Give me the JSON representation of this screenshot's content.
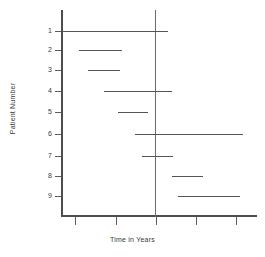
{
  "chart_data": {
    "type": "bar",
    "title": "",
    "subtitle": "",
    "xlabel": "Time in Years",
    "ylabel": "Patient Number",
    "orientation": "horizontal",
    "grid": false,
    "legend": null,
    "legend_position": "none",
    "categories": [
      "1",
      "2",
      "3",
      "4",
      "5",
      "6",
      "7",
      "8",
      "9"
    ],
    "xlim": [
      0,
      5
    ],
    "ylim": [
      0.5,
      9.5
    ],
    "xticks": [
      0,
      1,
      2,
      3,
      4
    ],
    "xticklabels": [
      "",
      "",
      "",
      "",
      ""
    ],
    "yticks": [
      1,
      2,
      3,
      4,
      5,
      6,
      7,
      8,
      9
    ],
    "yticklabels": [
      "1",
      "2",
      "3",
      "4",
      "5",
      "6",
      "7",
      "8",
      "9"
    ],
    "annotations": [
      {
        "name": "study-reference-line",
        "type": "vline",
        "x": 2.0,
        "label": ""
      }
    ],
    "series": [
      {
        "name": "Follow-up interval",
        "type": "range-bar",
        "values": [
          {
            "patient": "1",
            "start": 0.0,
            "end": 2.62
          },
          {
            "patient": "2",
            "start": 0.42,
            "end": 1.49
          },
          {
            "patient": "3",
            "start": 0.65,
            "end": 1.44
          },
          {
            "patient": "4",
            "start": 1.04,
            "end": 2.72
          },
          {
            "patient": "5",
            "start": 1.39,
            "end": 2.14
          },
          {
            "patient": "6",
            "start": 1.81,
            "end": 4.49
          },
          {
            "patient": "7",
            "start": 1.98,
            "end": 2.74
          },
          {
            "patient": "8",
            "start": 2.73,
            "end": 3.5
          },
          {
            "patient": "9",
            "start": 2.88,
            "end": 4.41
          }
        ]
      }
    ],
    "colors": {
      "axis": "#4d4d4d",
      "segment": "#555555",
      "reference_line": "#6b6b6b",
      "text": "#3a3a3a",
      "background": "#ffffff"
    }
  },
  "layout": {
    "plot": {
      "left_px": 62,
      "right_px": 257,
      "top_px": 10,
      "bottom_px": 216
    },
    "reference_line_px": 156,
    "x_tick_px": [
      75,
      116,
      156,
      196,
      236
    ],
    "row_px": [
      31,
      50,
      70,
      91,
      112,
      134,
      156,
      176,
      196
    ],
    "segment_px": [
      {
        "x1": 62,
        "x2": 168
      },
      {
        "x1": 79,
        "x2": 122
      },
      {
        "x1": 88,
        "x2": 120
      },
      {
        "x1": 104,
        "x2": 172
      },
      {
        "x1": 118,
        "x2": 148
      },
      {
        "x1": 135,
        "x2": 243
      },
      {
        "x1": 142,
        "x2": 173
      },
      {
        "x1": 172,
        "x2": 203
      },
      {
        "x1": 178,
        "x2": 240
      }
    ]
  }
}
